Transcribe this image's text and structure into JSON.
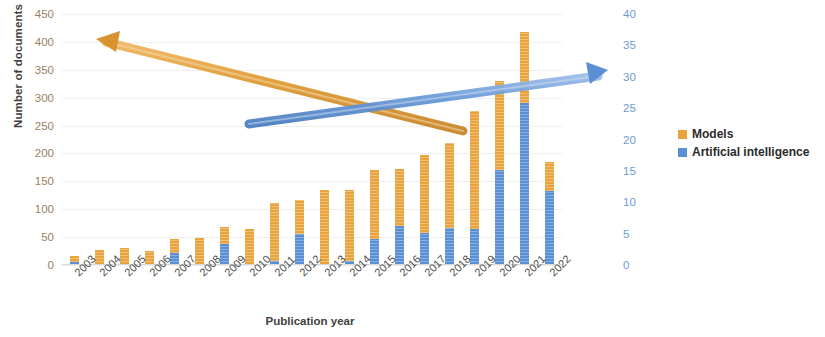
{
  "chart_data": {
    "type": "bar",
    "subtype": "stacked-column",
    "title": "",
    "xlabel": "Publication year",
    "ylabel": "Number of documents",
    "ylim": [
      0,
      450
    ],
    "yticks": [
      0,
      50,
      100,
      150,
      200,
      250,
      300,
      350,
      400,
      450
    ],
    "y2lim": [
      0,
      40
    ],
    "y2ticks": [
      0,
      5,
      10,
      15,
      20,
      25,
      30,
      35,
      40
    ],
    "grid": true,
    "legend_position": "right",
    "categories": [
      "2003",
      "2004",
      "2005",
      "2006",
      "2007",
      "2008",
      "2009",
      "2010",
      "2011",
      "2012",
      "2013",
      "2014",
      "2015",
      "2016",
      "2017",
      "2018",
      "2019",
      "2020",
      "2021",
      "2022"
    ],
    "series": [
      {
        "name": "Artificial intelligence",
        "color": "#5b8fd4",
        "axis": "secondary",
        "values": [
          6,
          0,
          0,
          0,
          22,
          0,
          38,
          0,
          7,
          55,
          0,
          7,
          46,
          70,
          57,
          67,
          65,
          170,
          290,
          133
        ]
      },
      {
        "name": "Models",
        "color": "#e8a33d",
        "axis": "primary",
        "values": [
          10,
          27,
          30,
          25,
          24,
          48,
          30,
          65,
          105,
          61,
          135,
          128,
          125,
          102,
          141,
          152,
          211,
          160,
          127,
          52
        ]
      }
    ],
    "totals": [
      16,
      27,
      30,
      25,
      46,
      48,
      68,
      65,
      112,
      116,
      135,
      135,
      171,
      172,
      198,
      219,
      276,
      330,
      417,
      185
    ],
    "annotations": [
      {
        "name": "declining-trend-arrow",
        "color": "#e8a33d",
        "from": "2019",
        "to": "2004",
        "direction": "down-left"
      },
      {
        "name": "rising-trend-arrow",
        "color": "#5b8fd4",
        "from": "2021",
        "to": "2022",
        "direction": "up-right"
      }
    ]
  },
  "legend": {
    "items": [
      {
        "label": "Models",
        "color": "#e8a33d"
      },
      {
        "label": "Artificial intelligence",
        "color": "#5b8fd4"
      }
    ]
  }
}
